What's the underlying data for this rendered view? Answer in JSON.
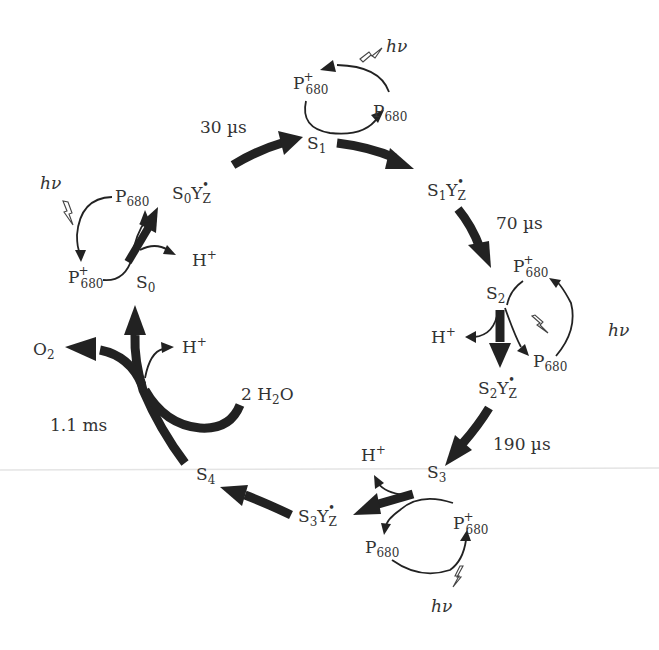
{
  "diagram": {
    "colors": {
      "ink": "#222222",
      "text": "#333333",
      "background": "#ffffff"
    },
    "states": {
      "s0": "S",
      "s0_sub": "0",
      "s1": "S",
      "s1_sub": "1",
      "s2": "S",
      "s2_sub": "2",
      "s3": "S",
      "s3_sub": "3",
      "s4": "S",
      "s4_sub": "4"
    },
    "intermediates": {
      "s0yz": {
        "s": "S",
        "n": "0",
        "y": "Y",
        "z": "Z",
        "radical": "•"
      },
      "s1yz": {
        "s": "S",
        "n": "1",
        "y": "Y",
        "z": "Z",
        "radical": "•"
      },
      "s2yz": {
        "s": "S",
        "n": "2",
        "y": "Y",
        "z": "Z",
        "radical": "•"
      },
      "s3yz": {
        "s": "S",
        "n": "3",
        "y": "Y",
        "z": "Z",
        "radical": "•"
      }
    },
    "time_constants": {
      "s0_to_s1": "30 µs",
      "s1_to_s2": "70 µs",
      "s2_to_s3": "190 µs",
      "s4_to_s0": "1.1 ms"
    },
    "p680": {
      "base": "P",
      "sub": "680",
      "plus": "+"
    },
    "light": {
      "h": "h",
      "nu": "ν"
    },
    "proton": {
      "h": "H",
      "plus": "+"
    },
    "oxygen": {
      "o": "O",
      "sub": "2"
    },
    "water": {
      "coef": "2 H",
      "sub": "2",
      "o": "O"
    }
  }
}
